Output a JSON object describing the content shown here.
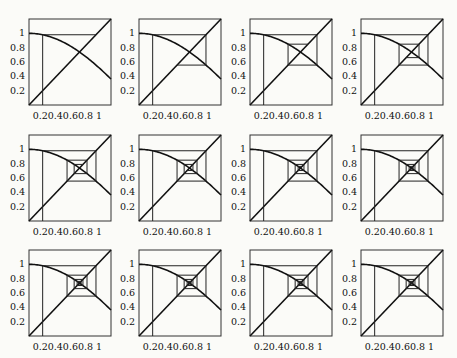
{
  "figure": {
    "layout": {
      "rows": 3,
      "cols": 4
    },
    "function": "cos(x)",
    "x0": 0.2,
    "axis_range": [
      0,
      1.2
    ],
    "yticks": [
      "1",
      "0.8",
      "0.6",
      "0.4",
      "0.2"
    ],
    "ytick_values": [
      1,
      0.8,
      0.6,
      0.4,
      0.2
    ],
    "xtick_label": "0.20.40.60.8  1"
  },
  "chart_data": {
    "type": "line",
    "title": "",
    "xlabel": "",
    "ylabel": "",
    "xlim": [
      0,
      1.2
    ],
    "ylim": [
      0,
      1.2
    ],
    "x_ticks": [
      0.2,
      0.4,
      0.6,
      0.8,
      1
    ],
    "y_ticks": [
      0.2,
      0.4,
      0.6,
      0.8,
      1
    ],
    "series": [
      {
        "name": "y = cos(x)"
      },
      {
        "name": "y = x"
      },
      {
        "name": "cobweb path",
        "x0": 0.2
      }
    ],
    "panels": [
      {
        "iterations": 1
      },
      {
        "iterations": 2
      },
      {
        "iterations": 3
      },
      {
        "iterations": 4
      },
      {
        "iterations": 5
      },
      {
        "iterations": 6
      },
      {
        "iterations": 7
      },
      {
        "iterations": 8
      },
      {
        "iterations": 9
      },
      {
        "iterations": 10
      },
      {
        "iterations": 11
      },
      {
        "iterations": 12
      }
    ],
    "fixed_point": 0.739,
    "grid": false,
    "legend": "none"
  }
}
